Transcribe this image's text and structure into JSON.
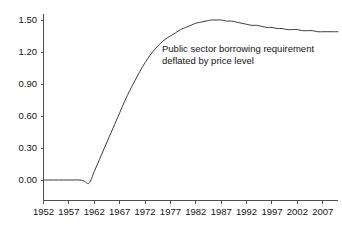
{
  "chart_data": {
    "type": "line",
    "title": "",
    "subtitle": "",
    "xlabel": "",
    "ylabel": "",
    "xlim": [
      1952,
      2010
    ],
    "ylim": [
      0.0,
      1.5
    ],
    "grid": false,
    "legend_position": "none",
    "annotations": [
      {
        "text_lines": [
          "Public sector borrowing requirement",
          "deflated by price level"
        ],
        "x": 1972,
        "y": 1.26
      }
    ],
    "y_ticks": [
      "1.50",
      "1.20",
      "0.90",
      "0.60",
      "0.30",
      "0.00"
    ],
    "y_tick_values": [
      1.5,
      1.2,
      0.9,
      0.6,
      0.3,
      0.0
    ],
    "x_ticks": [
      "1952",
      "1957",
      "1962",
      "1967",
      "1972",
      "1977",
      "1982",
      "1987",
      "1992",
      "1997",
      "2002",
      "2007"
    ],
    "x_tick_values": [
      1952,
      1957,
      1962,
      1967,
      1972,
      1977,
      1982,
      1987,
      1992,
      1997,
      2002,
      2007
    ],
    "series": [
      {
        "name": "Public sector borrowing requirement deflated by price level",
        "color": "#3c3c3c",
        "x": [
          1952,
          1953,
          1954,
          1955,
          1956,
          1957,
          1958,
          1959,
          1960,
          1961,
          1962,
          1963,
          1964,
          1965,
          1966,
          1967,
          1968,
          1969,
          1970,
          1971,
          1972,
          1973,
          1974,
          1975,
          1976,
          1977,
          1978,
          1979,
          1980,
          1981,
          1982,
          1983,
          1984,
          1985,
          1986,
          1987,
          1988,
          1989,
          1990,
          1991,
          1992,
          1993,
          1994,
          1995,
          1996,
          1997,
          1998,
          1999,
          2000,
          2001,
          2002,
          2003,
          2004,
          2005,
          2006,
          2007,
          2008,
          2009,
          2010
        ],
        "values": [
          0.0,
          0.0,
          0.0,
          0.0,
          0.0,
          0.0,
          0.0,
          0.0,
          -0.01,
          -0.03,
          0.08,
          0.19,
          0.3,
          0.41,
          0.52,
          0.63,
          0.74,
          0.84,
          0.93,
          1.02,
          1.1,
          1.17,
          1.23,
          1.28,
          1.32,
          1.35,
          1.38,
          1.41,
          1.43,
          1.45,
          1.47,
          1.48,
          1.49,
          1.5,
          1.5,
          1.5,
          1.49,
          1.49,
          1.48,
          1.47,
          1.46,
          1.45,
          1.45,
          1.44,
          1.43,
          1.43,
          1.42,
          1.42,
          1.41,
          1.41,
          1.41,
          1.4,
          1.4,
          1.4,
          1.39,
          1.39,
          1.39,
          1.39,
          1.39
        ]
      }
    ]
  },
  "colors": {
    "background": "#ffffff",
    "axis": "#4d4d4d",
    "line": "#3c3c3c",
    "text": "#141414"
  }
}
